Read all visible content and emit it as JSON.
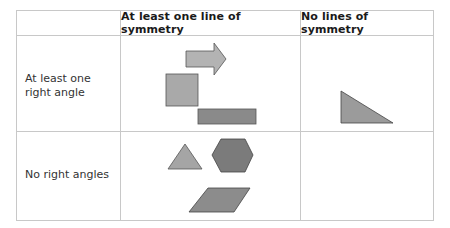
{
  "table": {
    "columns": [
      {
        "label": ""
      },
      {
        "label": "At least one line of symmetry"
      },
      {
        "label": "No lines of symmetry"
      }
    ],
    "rows": [
      {
        "label": "At least one right angle",
        "at_least_one_line_of_symmetry": [
          "arrow",
          "square",
          "rectangle"
        ],
        "no_lines_of_symmetry": [
          "right-triangle"
        ]
      },
      {
        "label": "No right angles",
        "at_least_one_line_of_symmetry": [
          "equilateral-triangle",
          "hexagon",
          "parallelogram"
        ],
        "no_lines_of_symmetry": []
      }
    ]
  },
  "colors": {
    "grid": "#c8c8c8",
    "outline": "#555555",
    "arrow": "#b3b3b3",
    "square": "#a9a9a9",
    "rectangle": "#8a8a8a",
    "right_triangle": "#9b9b9b",
    "small_triangle": "#a5a5a5",
    "hexagon": "#7b7b7b",
    "parallelogram": "#8c8c8c"
  }
}
